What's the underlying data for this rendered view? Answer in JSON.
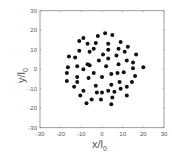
{
  "chart_data": {
    "type": "scatter",
    "title": "",
    "xlabel": "x/l",
    "xlabel_sub": "0",
    "ylabel": "y/l",
    "ylabel_sub": "0",
    "xlim": [
      -30,
      30
    ],
    "ylim": [
      -30,
      30
    ],
    "xticks": [
      -30,
      -20,
      -10,
      0,
      10,
      20,
      30
    ],
    "yticks": [
      -30,
      -20,
      -10,
      0,
      10,
      20,
      30
    ],
    "grid": false,
    "legend": null,
    "marker_color": "#111111",
    "points": [
      [
        1.5,
        18.5
      ],
      [
        5,
        17.5
      ],
      [
        -9,
        16
      ],
      [
        -2,
        17
      ],
      [
        -11,
        14.5
      ],
      [
        9,
        14
      ],
      [
        -7,
        13
      ],
      [
        -3,
        13.5
      ],
      [
        3,
        13
      ],
      [
        12.5,
        11.5
      ],
      [
        -4,
        10.5
      ],
      [
        -6,
        9
      ],
      [
        3,
        10
      ],
      [
        8,
        10.5
      ],
      [
        -11,
        9.5
      ],
      [
        11,
        9
      ],
      [
        0.5,
        7.5
      ],
      [
        -16,
        6.5
      ],
      [
        -13,
        6
      ],
      [
        7,
        7
      ],
      [
        16.5,
        7.5
      ],
      [
        3,
        5.5
      ],
      [
        -1.5,
        4.5
      ],
      [
        12,
        4.5
      ],
      [
        15,
        3.5
      ],
      [
        -7,
        2.5
      ],
      [
        -6,
        2
      ],
      [
        8,
        2.5
      ],
      [
        -12,
        1.5
      ],
      [
        2,
        1.5
      ],
      [
        -16.5,
        1
      ],
      [
        20,
        1
      ],
      [
        15,
        0.5
      ],
      [
        -9,
        0
      ],
      [
        -17,
        -2
      ],
      [
        -4,
        -2
      ],
      [
        7.5,
        -2
      ],
      [
        10.5,
        -1.5
      ],
      [
        4.5,
        -2.5
      ],
      [
        -12,
        -4
      ],
      [
        -6.5,
        -4.5
      ],
      [
        0,
        -4
      ],
      [
        16,
        -3.5
      ],
      [
        -17,
        -6
      ],
      [
        -12,
        -6.5
      ],
      [
        8.5,
        -6.5
      ],
      [
        14.5,
        -6.5
      ],
      [
        4.5,
        -8
      ],
      [
        -3,
        -8.5
      ],
      [
        -13.5,
        -9
      ],
      [
        -9,
        -11
      ],
      [
        12,
        -9
      ],
      [
        9,
        -10
      ],
      [
        -2.5,
        -12
      ],
      [
        0,
        -12
      ],
      [
        3,
        -11
      ],
      [
        6,
        -11.5
      ],
      [
        -10.5,
        -13.5
      ],
      [
        12,
        -13.5
      ],
      [
        -5,
        -15.5
      ],
      [
        -0.5,
        -15.5
      ],
      [
        5,
        -14.5
      ],
      [
        -7.5,
        -17.5
      ],
      [
        4.5,
        -18
      ]
    ]
  }
}
